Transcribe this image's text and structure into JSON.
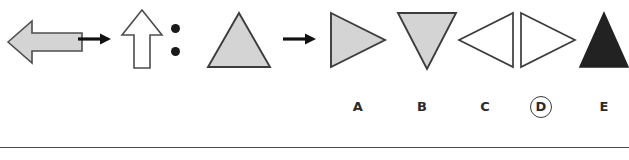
{
  "puzzle": {
    "type": "visual-analogy-matrix",
    "stem": {
      "source": {
        "name": "gray-left-block-arrow",
        "shape": "block-arrow",
        "direction": "left",
        "fill": "#d4d4d4",
        "stroke": "#4d4d4d"
      },
      "relation_operator": "→",
      "result": {
        "name": "white-up-block-arrow",
        "shape": "block-arrow",
        "direction": "up",
        "fill": "#ffffff",
        "stroke": "#4d4d4d"
      },
      "separator": ":",
      "query_source": {
        "name": "gray-up-triangle",
        "shape": "triangle",
        "direction": "up",
        "fill": "#d4d4d4",
        "stroke": "#3c3c3c"
      },
      "query_operator": "→"
    },
    "options": [
      {
        "letter": "A",
        "name": "gray-right-triangle",
        "shape": "triangle",
        "direction": "right",
        "fill": "#d4d4d4",
        "stroke": "#3c3c3c",
        "selected": false
      },
      {
        "letter": "B",
        "name": "gray-down-triangle",
        "shape": "triangle",
        "direction": "down",
        "fill": "#d4d4d4",
        "stroke": "#3c3c3c",
        "selected": false
      },
      {
        "letter": "C",
        "name": "white-left-triangle",
        "shape": "triangle",
        "direction": "left",
        "fill": "#ffffff",
        "stroke": "#3c3c3c",
        "selected": false
      },
      {
        "letter": "D",
        "name": "white-right-triangle",
        "shape": "triangle",
        "direction": "right",
        "fill": "#ffffff",
        "stroke": "#3c3c3c",
        "selected": true
      },
      {
        "letter": "E",
        "name": "black-up-triangle",
        "shape": "triangle",
        "direction": "up",
        "fill": "#222222",
        "stroke": "#222222",
        "selected": false
      }
    ],
    "selected_answer": "D",
    "colors": {
      "gray_fill": "#d4d4d4",
      "white_fill": "#ffffff",
      "black_fill": "#222222",
      "outline": "#4d4d4d",
      "label_text": "#2b2b2b",
      "rule": "#4a4a4a",
      "page_background": "#ffffff"
    }
  }
}
